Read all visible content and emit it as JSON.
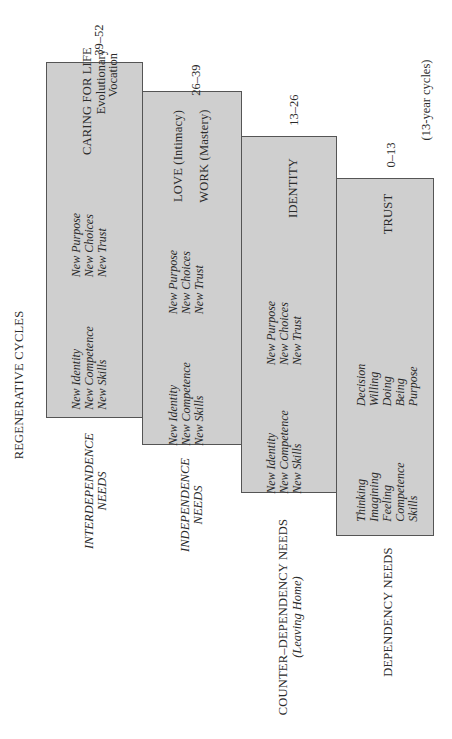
{
  "title": "REGENERATIVE CYCLES",
  "cycle_note": "(13-year cycles)",
  "stages": [
    {
      "age": "39–52",
      "label": "INTERDEPENDENCE NEEDS",
      "label_line1": "INTERDEPENDENCE",
      "label_line2": "NEEDS",
      "heading": "CARING FOR LIFE",
      "heading_sub1": "Evolutionary",
      "heading_sub2": "Vocation",
      "needs_a": [
        "New Identity",
        "New Competence",
        "New Skills"
      ],
      "needs_b": [
        "New Purpose",
        "New Choices",
        "New Trust"
      ]
    },
    {
      "age": "26–39",
      "label_line1": "INDEPENDENCE",
      "label_line2": "NEEDS",
      "heading": "LOVE (Intimacy)",
      "heading2": "WORK (Mastery)",
      "needs_a": [
        "New Identity",
        "New Competence",
        "New Skills"
      ],
      "needs_b": [
        "New Purpose",
        "New Choices",
        "New Trust"
      ]
    },
    {
      "age": "13–26",
      "label_line1": "COUNTER–DEPENDENCY NEEDS",
      "label_line2": "(Leaving Home)",
      "heading": "IDENTITY",
      "needs_a": [
        "New Identity",
        "New Competence",
        "New Skills"
      ],
      "needs_b": [
        "New Purpose",
        "New Choices",
        "New Trust"
      ]
    },
    {
      "age": "0–13",
      "label_line1": "DEPENDENCY NEEDS",
      "heading": "TRUST",
      "needs_a": [
        "Thinking",
        "Imagining",
        "Feeling",
        "Competence",
        "Skills"
      ],
      "needs_b": [
        "Decision",
        "Willing",
        "Doing",
        "Being",
        "Purpose"
      ]
    }
  ]
}
